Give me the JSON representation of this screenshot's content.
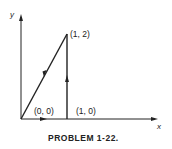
{
  "figure": {
    "caption": "PROBLEM 1-22.",
    "axes": {
      "x_label": "x",
      "y_label": "y"
    },
    "points": [
      {
        "id": "origin",
        "label": "(0, 0)",
        "x": 0,
        "y": 0
      },
      {
        "id": "p10",
        "label": "(1, 0)",
        "x": 1,
        "y": 0
      },
      {
        "id": "p12",
        "label": "(1, 2)",
        "x": 1,
        "y": 2
      }
    ],
    "path": [
      {
        "from": "origin",
        "to": "p10",
        "direction": "right"
      },
      {
        "from": "p10",
        "to": "p12",
        "direction": "up"
      },
      {
        "from": "p12",
        "to": "origin",
        "direction": "down-left"
      }
    ],
    "colors": {
      "ink": "#222222",
      "background": "#ffffff"
    }
  }
}
